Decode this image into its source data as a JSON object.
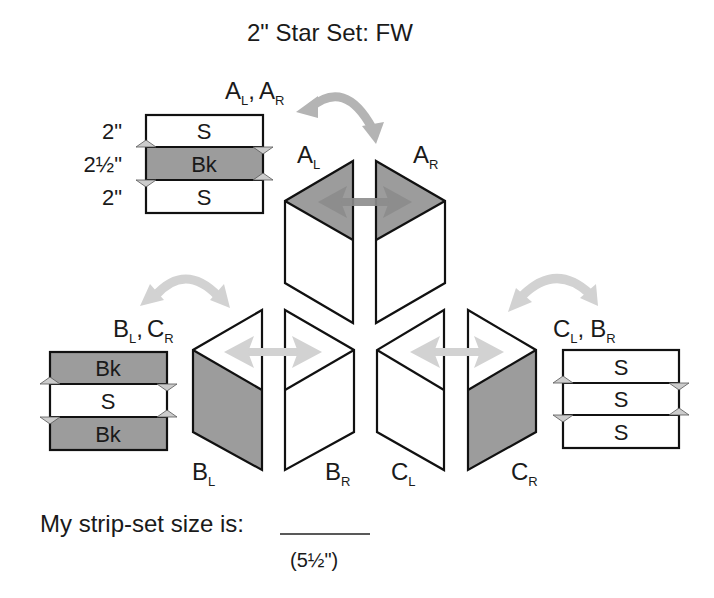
{
  "title": "2\" Star Set: FW",
  "colors": {
    "dark_fill": "#9c9c9c",
    "light_fill": "#ffffff",
    "outline": "#111111",
    "arrow_dark": "#8c8c8c",
    "arrow_mid": "#b4b4b4",
    "arrow_light": "#d2d2d2"
  },
  "strip_sets": [
    {
      "id": "A",
      "label_main_1": "A",
      "label_sub_1": "L",
      "label_sep": ",",
      "label_main_2": "A",
      "label_sub_2": "R",
      "bands": [
        {
          "text": "S",
          "fabric": "light",
          "size": "2\""
        },
        {
          "text": "Bk",
          "fabric": "dark",
          "size": "2½\""
        },
        {
          "text": "S",
          "fabric": "light",
          "size": "2\""
        }
      ]
    },
    {
      "id": "B",
      "label_main_1": "B",
      "label_sub_1": "L",
      "label_sep": ",",
      "label_main_2": "C",
      "label_sub_2": "R",
      "bands": [
        {
          "text": "Bk",
          "fabric": "dark"
        },
        {
          "text": "S",
          "fabric": "light"
        },
        {
          "text": "Bk",
          "fabric": "dark"
        }
      ]
    },
    {
      "id": "C",
      "label_main_1": "C",
      "label_sub_1": "L",
      "label_sep": ",",
      "label_main_2": "B",
      "label_sub_2": "R",
      "bands": [
        {
          "text": "S",
          "fabric": "light"
        },
        {
          "text": "S",
          "fabric": "light"
        },
        {
          "text": "S",
          "fabric": "light"
        }
      ]
    }
  ],
  "pieces": {
    "AL": {
      "main": "A",
      "sub": "L"
    },
    "AR": {
      "main": "A",
      "sub": "R"
    },
    "BL": {
      "main": "B",
      "sub": "L"
    },
    "BR": {
      "main": "B",
      "sub": "R"
    },
    "CL": {
      "main": "C",
      "sub": "L"
    },
    "CR": {
      "main": "C",
      "sub": "R"
    }
  },
  "footer": {
    "prompt": "My strip-set size is:",
    "answer_blank": "",
    "hint": "(5½\")"
  }
}
